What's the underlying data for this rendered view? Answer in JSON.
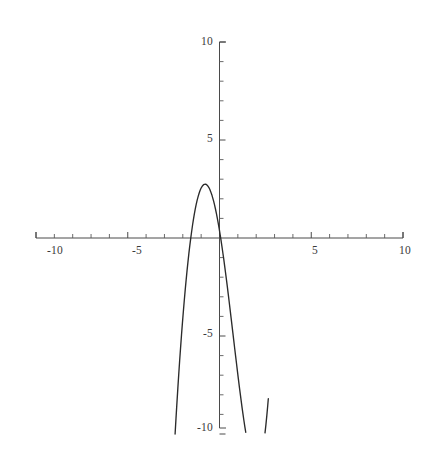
{
  "figure": {
    "title": "",
    "background_color": "#ffffff",
    "width": 433,
    "height": 452
  },
  "chart_data": {
    "type": "line",
    "title": "",
    "subtitle": "",
    "xlabel": "",
    "ylabel": "",
    "xlim": [
      -10,
      10
    ],
    "ylim": [
      -10,
      10
    ],
    "grid": false,
    "legend": null,
    "legend_position": "none",
    "axes_style": "centered-cross",
    "curve_color": "#2b2b2b",
    "axis_color": "#4a4a4a",
    "function_expression": "x^3 + x^2 - 2.9x + 0.14",
    "x_ticks_major": [
      -10,
      -5,
      5,
      10
    ],
    "x_tick_labels": [
      "-10",
      "-5",
      "5",
      "10"
    ],
    "y_ticks_major": [
      10,
      5,
      -5,
      -10
    ],
    "y_tick_labels": [
      "10",
      "5",
      "-5",
      "-10"
    ],
    "x_ticks_minor": [
      -9,
      -8,
      -7,
      -6,
      -4,
      -3,
      -2,
      -1,
      1,
      2,
      3,
      4,
      6,
      7,
      8,
      9
    ],
    "y_ticks_minor": [
      9,
      8,
      7,
      6,
      4,
      3,
      2,
      1,
      -1,
      -2,
      -3,
      -4,
      -6,
      -7,
      -8,
      -9
    ],
    "features": {
      "local_max": {
        "x": -1.28,
        "y": 2.2
      },
      "local_min": {
        "x": 0.65,
        "y": -0.3
      },
      "roots": [
        -2.3,
        0.05,
        1.27
      ],
      "y_intercept": 0.14,
      "visible_domain": [
        -2.42,
        2.66
      ]
    },
    "series": [
      {
        "name": "cubic",
        "x": [
          -2.42,
          -2.37,
          -2.32,
          -2.27,
          -2.22,
          -2.17,
          -2.12,
          -2.07,
          -2.02,
          -1.97,
          -1.92,
          -1.87,
          -1.82,
          -1.77,
          -1.72,
          -1.67,
          -1.62,
          -1.57,
          -1.52,
          -1.47,
          -1.42,
          -1.37,
          -1.32,
          -1.27,
          -1.22,
          -1.17,
          -1.12,
          -1.07,
          -1.02,
          -0.97,
          -0.92,
          -0.87,
          -0.82,
          -0.77,
          -0.72,
          -0.67,
          -0.62,
          -0.57,
          -0.52,
          -0.47,
          -0.42,
          -0.37,
          -0.32,
          -0.27,
          -0.22,
          -0.17,
          -0.12,
          -0.07,
          -0.02,
          0.03,
          0.08,
          0.13,
          0.18,
          0.23,
          0.28,
          0.33,
          0.38,
          0.43,
          0.48,
          0.53,
          0.58,
          0.63,
          0.68,
          0.73,
          0.78,
          0.83,
          0.88,
          0.93,
          0.98,
          1.03,
          1.08,
          1.13,
          1.18,
          1.23,
          1.28,
          1.33,
          1.38,
          1.43,
          1.48,
          1.53,
          1.58,
          1.63,
          1.68,
          1.73,
          1.78,
          1.83,
          1.88,
          1.93,
          1.98,
          2.03,
          2.08,
          2.13,
          2.18,
          2.23,
          2.28,
          2.33,
          2.38,
          2.43,
          2.48,
          2.53,
          2.58,
          2.63,
          2.66
        ],
        "y": [
          -10.0,
          -9.19,
          -8.41,
          -7.66,
          -6.94,
          -6.24,
          -5.58,
          -4.94,
          -4.33,
          -3.75,
          -3.19,
          -2.66,
          -2.16,
          -1.68,
          -1.23,
          -0.8,
          -0.4,
          -0.03,
          0.32,
          0.65,
          0.95,
          1.23,
          1.48,
          1.71,
          1.92,
          2.1,
          2.26,
          2.4,
          2.51,
          2.6,
          2.67,
          2.72,
          2.74,
          2.75,
          2.73,
          2.69,
          2.63,
          2.56,
          2.46,
          2.34,
          2.21,
          2.05,
          1.88,
          1.69,
          1.48,
          1.26,
          1.02,
          0.76,
          0.49,
          0.2,
          -0.1,
          -0.41,
          -0.74,
          -1.07,
          -1.42,
          -1.78,
          -2.14,
          -2.51,
          -2.89,
          -3.28,
          -3.67,
          -4.06,
          -4.46,
          -4.85,
          -5.25,
          -5.65,
          -6.04,
          -6.43,
          -6.82,
          -7.2,
          -7.58,
          -7.94,
          -8.3,
          -8.65,
          -8.99,
          -9.31,
          -9.62,
          -9.91,
          -10.19,
          -10.45,
          -10.69,
          -10.9,
          -11.1,
          -11.27,
          -11.41,
          -11.53,
          -11.62,
          -11.68,
          -11.71,
          -11.71,
          -11.67,
          -11.59,
          -11.48,
          -11.33,
          -11.14,
          -10.91,
          -10.63,
          -10.31,
          -9.94,
          -9.52,
          -9.05,
          -8.53,
          -8.2
        ]
      }
    ]
  },
  "axis_labels": {
    "x_neg_10": "-10",
    "x_neg_5": "-5",
    "x_pos_5": "5",
    "x_pos_10": "10",
    "y_pos_10": "10",
    "y_pos_5": "5",
    "y_neg_5": "-5",
    "y_neg_10": "-10"
  }
}
